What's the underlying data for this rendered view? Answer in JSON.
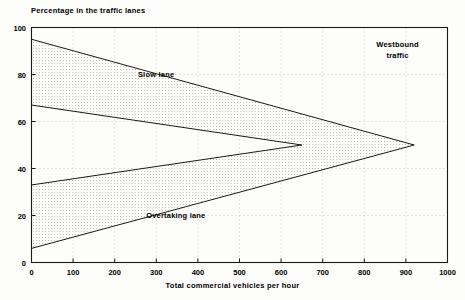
{
  "chart_data": {
    "type": "area",
    "title": "Percentage in the traffic lanes",
    "xlabel": "Total commercial vehicles per hour",
    "ylabel": "Percentage in the traffic lanes",
    "xlim": [
      0,
      1000
    ],
    "ylim": [
      0,
      100
    ],
    "xticks": [
      0,
      100,
      200,
      300,
      400,
      500,
      600,
      700,
      800,
      900,
      1000
    ],
    "yticks": [
      0,
      20,
      40,
      60,
      80,
      100
    ],
    "grid": true,
    "legend": "none",
    "annotations": [
      {
        "text": "Slow lane",
        "x": 400,
        "y": 80
      },
      {
        "text": "Overtaking lane",
        "x": 420,
        "y": 20
      },
      {
        "text": "Westbound traffic",
        "x": 880,
        "y": 93
      }
    ],
    "series": [
      {
        "name": "Slow lane upper boundary",
        "points": [
          [
            0,
            95
          ],
          [
            920,
            50
          ]
        ]
      },
      {
        "name": "Slow lane lower boundary",
        "points": [
          [
            0,
            67
          ],
          [
            650,
            50
          ]
        ]
      },
      {
        "name": "Overtaking lane upper boundary",
        "points": [
          [
            0,
            33
          ],
          [
            650,
            50
          ]
        ]
      },
      {
        "name": "Overtaking lane lower boundary",
        "points": [
          [
            0,
            6
          ],
          [
            920,
            50
          ]
        ]
      }
    ],
    "bands": [
      {
        "name": "Slow lane band",
        "fill": "stipple",
        "upper": [
          [
            0,
            95
          ],
          [
            920,
            50
          ]
        ],
        "lower": [
          [
            0,
            67
          ],
          [
            650,
            50
          ],
          [
            920,
            50
          ]
        ]
      },
      {
        "name": "Overtaking lane band",
        "fill": "stipple",
        "upper": [
          [
            0,
            33
          ],
          [
            650,
            50
          ],
          [
            920,
            50
          ]
        ],
        "lower": [
          [
            0,
            6
          ],
          [
            920,
            50
          ]
        ]
      }
    ]
  },
  "axes": {
    "y_tick_labels": [
      "0",
      "20",
      "40",
      "60",
      "80",
      "100"
    ],
    "x_tick_labels": [
      "0",
      "100",
      "200",
      "300",
      "400",
      "500",
      "600",
      "700",
      "800",
      "900",
      "1000"
    ]
  },
  "labels": {
    "title": "Percentage in the traffic lanes",
    "x_axis": "Total commercial vehicles per hour",
    "slow_lane": "Slow lane",
    "overtaking_lane": "Overtaking lane",
    "westbound_line1": "Westbound",
    "westbound_line2": "traffic"
  },
  "colors": {
    "ink": "#1a1a1a",
    "grid": "#b9b9b9",
    "fill": "#e8e8e2",
    "background": "#fdfdfb"
  }
}
